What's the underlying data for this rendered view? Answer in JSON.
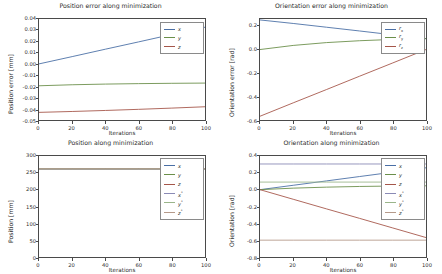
{
  "figure": {
    "background": "#ffffff",
    "width": 442,
    "height": 274
  },
  "chart_data": [
    {
      "id": "position-error",
      "type": "line",
      "title": "Position error along minimization",
      "xlabel": "Iterations",
      "ylabel": "Position error [mm]",
      "xlim": [
        0,
        100
      ],
      "ylim": [
        -0.05,
        0.04
      ],
      "xticks": [
        "0",
        "20",
        "40",
        "60",
        "80",
        "100"
      ],
      "xtick_values": [
        0,
        20,
        40,
        60,
        80,
        100
      ],
      "yticks": [
        "0.04",
        "0.03",
        "0.02",
        "0.01",
        "0.00",
        "-0.01",
        "-0.02",
        "-0.03",
        "-0.04",
        "-0.05"
      ],
      "ytick_values": [
        0.04,
        0.03,
        0.02,
        0.01,
        0.0,
        -0.01,
        -0.02,
        -0.03,
        -0.04,
        -0.05
      ],
      "grid": false,
      "legend_position": "upper right",
      "x": [
        0,
        20,
        40,
        60,
        80,
        100
      ],
      "series": [
        {
          "name": "x",
          "color": "#4a6fa5",
          "values": [
            0.0,
            0.0065,
            0.0131,
            0.0196,
            0.0262,
            0.0327
          ]
        },
        {
          "name": "y",
          "color": "#6b8f4a",
          "values": [
            -0.0195,
            -0.0186,
            -0.018,
            -0.0176,
            -0.0173,
            -0.0171
          ]
        },
        {
          "name": "z",
          "color": "#a5564a",
          "values": [
            -0.0432,
            -0.0424,
            -0.0415,
            -0.0405,
            -0.0394,
            -0.0382
          ]
        }
      ],
      "legend": [
        {
          "label": "x",
          "color": "#4a6fa5"
        },
        {
          "label": "y",
          "color": "#6b8f4a"
        },
        {
          "label": "z",
          "color": "#a5564a"
        }
      ]
    },
    {
      "id": "orientation-error",
      "type": "line",
      "title": "Orientation error along minimization",
      "xlabel": "Iterations",
      "ylabel": "Orientation error [rad]",
      "xlim": [
        0,
        100
      ],
      "ylim": [
        -0.6,
        0.26
      ],
      "xticks": [
        "0",
        "20",
        "40",
        "60",
        "80",
        "100"
      ],
      "xtick_values": [
        0,
        20,
        40,
        60,
        80,
        100
      ],
      "yticks": [
        "0.2",
        "0.0",
        "-0.2",
        "-0.4",
        "-0.6"
      ],
      "ytick_values": [
        0.2,
        0.0,
        -0.2,
        -0.4,
        -0.6
      ],
      "grid": false,
      "legend_position": "upper right",
      "x": [
        0,
        20,
        40,
        60,
        80,
        100
      ],
      "series": [
        {
          "name": "r_x",
          "color": "#4a6fa5",
          "values": [
            0.252,
            0.222,
            0.19,
            0.158,
            0.125,
            0.093
          ]
        },
        {
          "name": "r_y",
          "color": "#6b8f4a",
          "values": [
            0.0,
            0.035,
            0.059,
            0.075,
            0.086,
            0.093
          ]
        },
        {
          "name": "r_z",
          "color": "#a5564a",
          "values": [
            -0.568,
            -0.454,
            -0.341,
            -0.227,
            -0.114,
            0.0
          ]
        }
      ],
      "legend": [
        {
          "label": "r",
          "sub": "x",
          "color": "#4a6fa5"
        },
        {
          "label": "r",
          "sub": "y",
          "color": "#6b8f4a"
        },
        {
          "label": "r",
          "sub": "z",
          "color": "#a5564a"
        }
      ]
    },
    {
      "id": "position",
      "type": "line",
      "title": "Position along minimization",
      "xlabel": "Iterations",
      "ylabel": "Position [mm]",
      "xlim": [
        0,
        100
      ],
      "ylim": [
        0,
        300
      ],
      "xticks": [
        "0",
        "20",
        "40",
        "60",
        "80",
        "100"
      ],
      "xtick_values": [
        0,
        20,
        40,
        60,
        80,
        100
      ],
      "yticks": [
        "300",
        "250",
        "200",
        "150",
        "100",
        "50",
        "0"
      ],
      "ytick_values": [
        300,
        250,
        200,
        150,
        100,
        50,
        0
      ],
      "grid": false,
      "legend_position": "upper right",
      "x": [
        0,
        20,
        40,
        60,
        80,
        100
      ],
      "series": [
        {
          "name": "x",
          "color": "#4a6fa5",
          "values": [
            262,
            262,
            262,
            262,
            262,
            262
          ]
        },
        {
          "name": "y",
          "color": "#6b8f4a",
          "values": [
            262,
            262,
            262,
            262,
            262,
            262
          ]
        },
        {
          "name": "z",
          "color": "#a5564a",
          "values": [
            262,
            262,
            262,
            262,
            262,
            262
          ]
        },
        {
          "name": "x*",
          "color": "#8a8ab5",
          "values": [
            262,
            262,
            262,
            262,
            262,
            262
          ]
        },
        {
          "name": "y*",
          "color": "#9ab58a",
          "values": [
            262,
            262,
            262,
            262,
            262,
            262
          ]
        },
        {
          "name": "z*",
          "color": "#b59a8a",
          "values": [
            262,
            262,
            262,
            262,
            262,
            262
          ]
        }
      ],
      "legend": [
        {
          "label": "x",
          "color": "#4a6fa5"
        },
        {
          "label": "y",
          "color": "#6b8f4a"
        },
        {
          "label": "z",
          "color": "#a5564a"
        },
        {
          "label": "x",
          "sup": "*",
          "color": "#8a8ab5"
        },
        {
          "label": "y",
          "sup": "*",
          "color": "#9ab58a"
        },
        {
          "label": "z",
          "sup": "*",
          "color": "#b59a8a"
        }
      ]
    },
    {
      "id": "orientation",
      "type": "line",
      "title": "Orientation along minimization",
      "xlabel": "Iterations",
      "ylabel": "Orientation [rad]",
      "xlim": [
        0,
        100
      ],
      "ylim": [
        -0.8,
        0.4
      ],
      "xticks": [
        "0",
        "20",
        "40",
        "60",
        "80",
        "100"
      ],
      "xtick_values": [
        0,
        20,
        40,
        60,
        80,
        100
      ],
      "yticks": [
        "0.4",
        "0.2",
        "0.0",
        "-0.2",
        "-0.4",
        "-0.6",
        "-0.8"
      ],
      "ytick_values": [
        0.4,
        0.2,
        0.0,
        -0.2,
        -0.4,
        -0.6,
        -0.8
      ],
      "grid": false,
      "legend_position": "upper right",
      "x": [
        0,
        20,
        40,
        60,
        80,
        100
      ],
      "series": [
        {
          "name": "x",
          "color": "#4a6fa5",
          "values": [
            0.0,
            0.052,
            0.104,
            0.156,
            0.208,
            0.26
          ]
        },
        {
          "name": "y",
          "color": "#6b8f4a",
          "values": [
            0.0,
            0.018,
            0.03,
            0.038,
            0.043,
            0.046
          ]
        },
        {
          "name": "z",
          "color": "#a5564a",
          "values": [
            0.0,
            -0.114,
            -0.228,
            -0.341,
            -0.455,
            -0.569
          ]
        },
        {
          "name": "x*",
          "color": "#8a8ab5",
          "values": [
            0.305,
            0.305,
            0.305,
            0.305,
            0.305,
            0.305
          ]
        },
        {
          "name": "y*",
          "color": "#9ab58a",
          "values": [
            0.09,
            0.09,
            0.09,
            0.09,
            0.09,
            0.09
          ]
        },
        {
          "name": "z*",
          "color": "#b59a8a",
          "values": [
            -0.6,
            -0.6,
            -0.6,
            -0.6,
            -0.6,
            -0.6
          ]
        }
      ],
      "legend": [
        {
          "label": "x",
          "color": "#4a6fa5"
        },
        {
          "label": "y",
          "color": "#6b8f4a"
        },
        {
          "label": "z",
          "color": "#a5564a"
        },
        {
          "label": "x",
          "sup": "*",
          "color": "#8a8ab5"
        },
        {
          "label": "y",
          "sup": "*",
          "color": "#9ab58a"
        },
        {
          "label": "z",
          "sup": "*",
          "color": "#b59a8a"
        }
      ]
    }
  ]
}
